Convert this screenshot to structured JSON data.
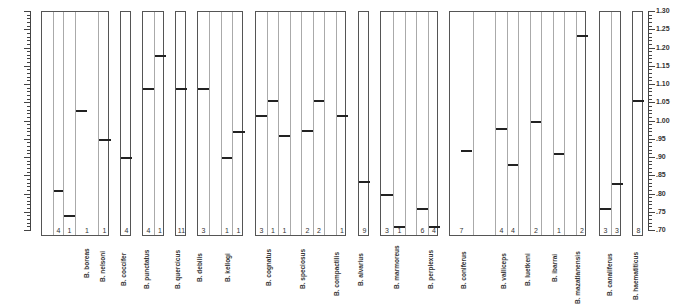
{
  "chart_data": {
    "type": "bar",
    "title": "",
    "xlabel": "",
    "ylabel": "",
    "ylim": [
      0.7,
      1.3
    ],
    "grid": false,
    "yticks": [
      "1.30",
      "1.25",
      "1.20",
      "1.15",
      "1.10",
      "1.05",
      "1.00",
      ".95",
      ".90",
      ".85",
      ".80",
      ".75",
      ".70"
    ],
    "ytick_values": [
      1.3,
      1.25,
      1.2,
      1.15,
      1.1,
      1.05,
      1.0,
      0.95,
      0.9,
      0.85,
      0.8,
      0.75,
      0.7
    ],
    "panels": [
      {
        "x": 41,
        "w": 68,
        "cols": [
          {
            "w": 11,
            "count": "",
            "value": null
          },
          {
            "w": 10,
            "count": "4",
            "value": 0.81
          },
          {
            "w": 12,
            "count": "1",
            "value": 0.74
          },
          {
            "w": 23,
            "count": "1",
            "value": 1.03,
            "bar_w": 11
          },
          {
            "w": 12,
            "count": "1",
            "value": 0.95
          }
        ]
      },
      {
        "x": 120,
        "w": 11,
        "cols": [
          {
            "w": 11,
            "count": "4",
            "value": 0.9
          }
        ]
      },
      {
        "x": 142,
        "w": 22,
        "cols": [
          {
            "w": 11,
            "count": "4",
            "value": 1.09
          },
          {
            "w": 11,
            "count": "1",
            "value": 1.18
          }
        ]
      },
      {
        "x": 175,
        "w": 11,
        "cols": [
          {
            "w": 11,
            "count": "11",
            "value": 1.09
          }
        ]
      },
      {
        "x": 197,
        "w": 46,
        "cols": [
          {
            "w": 11,
            "count": "3",
            "value": 1.09
          },
          {
            "w": 12,
            "count": "",
            "value": null
          },
          {
            "w": 11,
            "count": "1",
            "value": 0.9
          },
          {
            "w": 12,
            "count": "1",
            "value": 0.97
          }
        ]
      },
      {
        "x": 255,
        "w": 91,
        "cols": [
          {
            "w": 11,
            "count": "3",
            "value": 1.015
          },
          {
            "w": 11,
            "count": "1",
            "value": 1.055
          },
          {
            "w": 12,
            "count": "1",
            "value": 0.96
          },
          {
            "w": 11,
            "count": "",
            "value": null
          },
          {
            "w": 12,
            "count": "2",
            "value": 0.975
          },
          {
            "w": 11,
            "count": "2",
            "value": 1.055
          },
          {
            "w": 12,
            "count": "",
            "value": null
          },
          {
            "w": 11,
            "count": "1",
            "value": 1.015
          }
        ]
      },
      {
        "x": 358,
        "w": 11,
        "cols": [
          {
            "w": 11,
            "count": "9",
            "value": 0.835
          }
        ]
      },
      {
        "x": 380,
        "w": 58,
        "cols": [
          {
            "w": 12,
            "count": "3",
            "value": 0.8
          },
          {
            "w": 12,
            "count": "1",
            "value": 0.71
          },
          {
            "w": 11,
            "count": "",
            "value": null
          },
          {
            "w": 12,
            "count": "6",
            "value": 0.76
          },
          {
            "w": 11,
            "count": "4",
            "value": 0.71
          }
        ]
      },
      {
        "x": 449,
        "w": 137,
        "cols": [
          {
            "w": 23,
            "count": "7",
            "value": 0.92,
            "bar_w": 11,
            "bar_x": 11
          },
          {
            "w": 22,
            "count": "",
            "value": null
          },
          {
            "w": 12,
            "count": "4",
            "value": 0.98
          },
          {
            "w": 11,
            "count": "4",
            "value": 0.88
          },
          {
            "w": 12,
            "count": "",
            "value": null
          },
          {
            "w": 11,
            "count": "2",
            "value": 1.0
          },
          {
            "w": 12,
            "count": "",
            "value": null
          },
          {
            "w": 11,
            "count": "1",
            "value": 0.91
          },
          {
            "w": 12,
            "count": "",
            "value": null
          },
          {
            "w": 11,
            "count": "2",
            "value": 1.235
          }
        ]
      },
      {
        "x": 599,
        "w": 22,
        "cols": [
          {
            "w": 11,
            "count": "3",
            "value": 0.76
          },
          {
            "w": 11,
            "count": "3",
            "value": 0.83
          }
        ]
      },
      {
        "x": 632,
        "w": 11,
        "cols": [
          {
            "w": 11,
            "count": "8",
            "value": 1.055
          }
        ]
      }
    ],
    "species_labels": [
      {
        "x": 87,
        "text": "B. boreas"
      },
      {
        "x": 103,
        "text": "B. nelsoni"
      },
      {
        "x": 124,
        "text": "B. coccifer"
      },
      {
        "x": 147,
        "text": "B. punctatus"
      },
      {
        "x": 178,
        "text": "B. quercicus"
      },
      {
        "x": 200,
        "text": "B. debilis"
      },
      {
        "x": 228,
        "text": "B. kellogi"
      },
      {
        "x": 269,
        "text": "B. cognatus"
      },
      {
        "x": 303,
        "text": "B. speciosus"
      },
      {
        "x": 337,
        "text": "B. compactilis"
      },
      {
        "x": 361,
        "text": "B. alvarius"
      },
      {
        "x": 397,
        "text": "B. marmoreus"
      },
      {
        "x": 431,
        "text": "B. perplexus"
      },
      {
        "x": 464,
        "text": "B. coniferus"
      },
      {
        "x": 504,
        "text": "B. valliceps"
      },
      {
        "x": 528,
        "text": "B. luetkeni"
      },
      {
        "x": 555,
        "text": "B. ibarrai"
      },
      {
        "x": 578,
        "text": "B. mazatlanensis"
      },
      {
        "x": 610,
        "text": "B. canaliferus"
      },
      {
        "x": 636,
        "text": "B. haematiticus"
      }
    ]
  }
}
